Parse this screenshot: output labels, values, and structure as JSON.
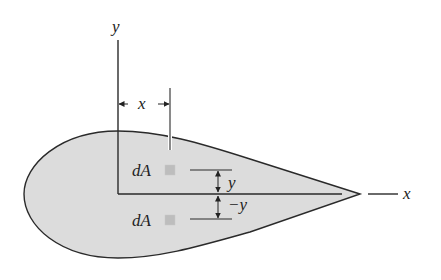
{
  "diagram": {
    "type": "area-moment-figure",
    "colors": {
      "background": "#ffffff",
      "shape_fill": "#dcdcdc",
      "outline": "#2a2a2a",
      "element_fill": "#bdbdbd"
    },
    "labels": {
      "y_axis": "y",
      "x_axis": "x",
      "x_distance": "x",
      "upper_element": "dA",
      "lower_element": "dA",
      "upper_distance": "y",
      "lower_distance": "−y"
    }
  }
}
